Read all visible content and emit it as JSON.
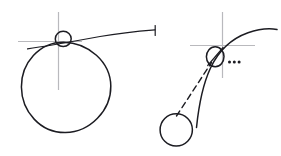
{
  "figure": {
    "background_color": "#ffffff",
    "ink_color": "#1c1c22",
    "axis_color": "#b9b9bd",
    "width": 281,
    "height": 156,
    "panels": [
      {
        "name": "left-panel",
        "description": "Large circle with a tangent line touching at the top, a small circle at the tangent point, and a faint crosshair through the tangent point",
        "elements": [
          {
            "name": "large-circle",
            "type": "circle",
            "cx": 66,
            "cy": 87,
            "r": 45
          },
          {
            "name": "tangent-point-circle",
            "type": "circle",
            "cx": 63,
            "cy": 39,
            "r": 8
          },
          {
            "name": "tangent-line",
            "type": "line",
            "x1": 27,
            "y1": 49,
            "x2": 155,
            "y2": 30
          },
          {
            "name": "tangent-end-tick",
            "type": "line",
            "x1": 155,
            "y1": 26,
            "x2": 155,
            "y2": 36
          },
          {
            "name": "crosshair-vertical",
            "type": "line",
            "x1": 58,
            "y1": 12,
            "x2": 58,
            "y2": 90
          },
          {
            "name": "crosshair-horizontal",
            "type": "line",
            "x1": 18,
            "y1": 41,
            "x2": 82,
            "y2": 41
          }
        ]
      },
      {
        "name": "right-panel",
        "description": "Curved trajectory rising to the right passing through a slashed small ellipse at a crosshair origin, with a dashed chord from a lower-left small circle and an ellipsis marker",
        "elements": [
          {
            "name": "trajectory-curve",
            "type": "curve",
            "from": [
              196,
              127
            ],
            "through": [
              216,
              58
            ],
            "to": [
              277,
              30
            ]
          },
          {
            "name": "focus-ellipse",
            "type": "ellipse",
            "cx": 215,
            "cy": 57,
            "rx": 9,
            "ry": 10
          },
          {
            "name": "focus-ellipse-slash",
            "type": "line",
            "x1": 208,
            "y1": 65,
            "x2": 223,
            "y2": 48
          },
          {
            "name": "crosshair-vertical",
            "type": "line",
            "x1": 222,
            "y1": 12,
            "x2": 222,
            "y2": 78
          },
          {
            "name": "crosshair-horizontal",
            "type": "line",
            "x1": 190,
            "y1": 45,
            "x2": 255,
            "y2": 45
          },
          {
            "name": "dashed-chord",
            "type": "dashed-line",
            "x1": 176,
            "y1": 116,
            "x2": 212,
            "y2": 62
          },
          {
            "name": "lower-small-circle",
            "type": "circle",
            "cx": 176,
            "cy": 130,
            "r": 16
          },
          {
            "name": "ellipsis-marker",
            "type": "dots",
            "count": 3,
            "x": 230,
            "y": 62,
            "label": "..."
          }
        ]
      }
    ]
  },
  "labels": {
    "ellipsis": "..."
  }
}
